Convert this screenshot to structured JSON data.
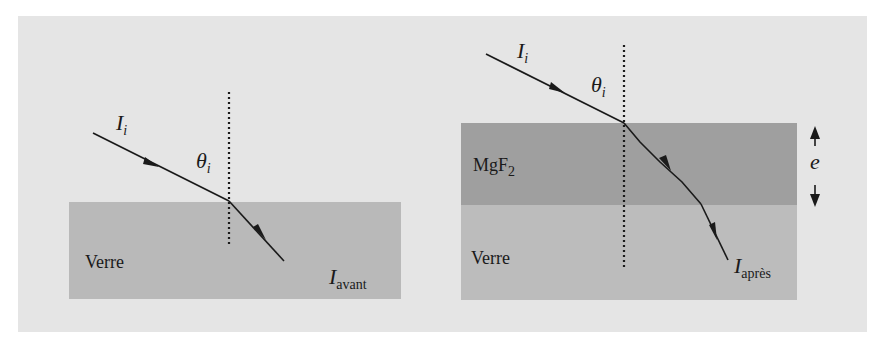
{
  "diagram": {
    "colors": {
      "page_background": "#ffffff",
      "frame_background": "#e5e5e5",
      "glass": "#b9b9b9",
      "glass_right": "#bcbcbc",
      "mgf2_layer": "#9f9f9f",
      "ray": "#1a1a1a"
    },
    "left_panel": {
      "title": "Without coating",
      "incident_label": {
        "symbol": "I",
        "subscript": "i"
      },
      "angle_label": {
        "symbol": "θ",
        "subscript": "i"
      },
      "medium_label": "Verre",
      "transmitted_label": {
        "symbol": "I",
        "subscript": "avant"
      }
    },
    "right_panel": {
      "title": "With MgF2 coating",
      "incident_label": {
        "symbol": "I",
        "subscript": "i"
      },
      "angle_label": {
        "symbol": "θ",
        "subscript": "i"
      },
      "layer_label": {
        "text": "MgF",
        "subscript": "2"
      },
      "medium_label": "Verre",
      "transmitted_label": {
        "symbol": "I",
        "subscript": "après"
      },
      "thickness_label": "e"
    }
  }
}
